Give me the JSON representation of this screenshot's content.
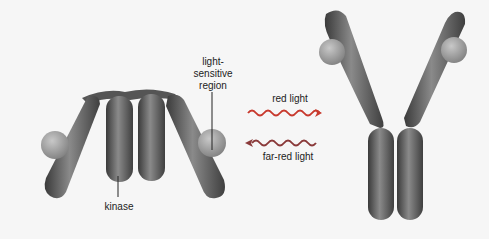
{
  "diagram": {
    "left_state": {
      "labels": {
        "light_sensitive_region": [
          "light-",
          "sensitive",
          "region"
        ],
        "kinase": "kinase"
      }
    },
    "arrows": {
      "forward": {
        "label": "red light",
        "direction": "right"
      },
      "reverse": {
        "label": "far-red light",
        "direction": "left"
      }
    },
    "right_state": {},
    "colors": {
      "background": "#f6f6f6",
      "protein": "#5a5a5a",
      "sphere": "#9a9a9a",
      "text": "#222222"
    }
  }
}
